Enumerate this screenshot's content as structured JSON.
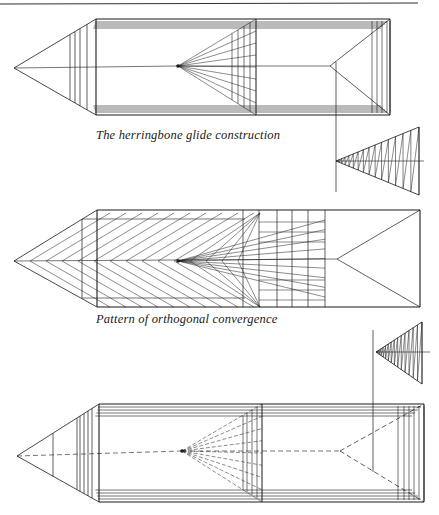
{
  "page": {
    "top_rule": {
      "x1": 0,
      "y1": 4,
      "x2": 418,
      "y2": 3
    },
    "ink_color": "#1a1a1a"
  },
  "figures": [
    {
      "id": "herringbone",
      "caption": "The herringbone glide construction",
      "caption_pos": {
        "x": 96,
        "y": 128
      },
      "apex": [
        14,
        68
      ],
      "vanishing_point": [
        178,
        66
      ],
      "far_point": [
        330,
        66
      ],
      "prism": {
        "x1": 96,
        "x2": 390,
        "top": 19,
        "bottom": 115
      },
      "left_verticals": [
        70,
        75,
        80,
        87,
        96
      ],
      "frustum_verticals": [
        232,
        238,
        244,
        250,
        256
      ],
      "far_frame_verticals": [
        372,
        377,
        382,
        387,
        390
      ],
      "aux_vertical": {
        "x": 336,
        "y1": 62,
        "y2": 192
      },
      "mini_triangle": {
        "apex": [
          336,
          161
        ],
        "top": [
          419,
          127
        ],
        "bottom": [
          419,
          195
        ],
        "axis_end": 424
      }
    },
    {
      "id": "orthogonal",
      "caption": "Pattern of orthogonal convergence",
      "caption_pos": {
        "x": 96,
        "y": 312
      },
      "apex": [
        14,
        261
      ],
      "vanishing_point": [
        178,
        261
      ],
      "far_point": [
        337,
        259
      ],
      "prism": {
        "x1": 97,
        "x2": 420,
        "top": 210,
        "bottom": 307
      },
      "left_verticals": [
        82,
        97
      ],
      "grid_columns": [
        243,
        259,
        277,
        292,
        308,
        325
      ]
    },
    {
      "id": "third",
      "caption": "",
      "apex": [
        17,
        456
      ],
      "vanishing_point": [
        182,
        451
      ],
      "far_point": [
        340,
        451
      ],
      "prism": {
        "x1": 99,
        "x2": 424,
        "top": 404,
        "bottom": 502
      },
      "left_verticals": [
        53,
        77,
        80,
        84,
        88,
        92,
        99
      ],
      "frustum_verticals": [
        243,
        247,
        252,
        257,
        262
      ],
      "far_frame_verticals": [
        398,
        404,
        409,
        414,
        419,
        424
      ],
      "aux_vertical": {
        "x": 373,
        "y1": 330,
        "y2": 472
      },
      "mini_triangle": {
        "apex": [
          376,
          352
        ],
        "top": [
          422,
          322
        ],
        "bottom": [
          422,
          384
        ],
        "axis_end": 430
      }
    }
  ]
}
